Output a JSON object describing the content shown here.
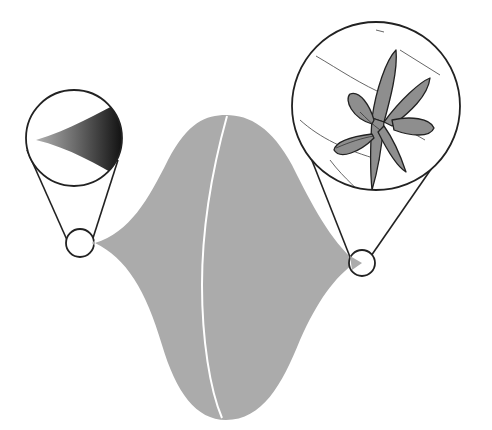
{
  "diagram": {
    "colors": {
      "background": "#ffffff",
      "body_fill": "#ababab",
      "meridian": "#ffffff",
      "outline": "#222222",
      "petal_fill": "#8e8e8e",
      "gradient_light": "#9a9a9a",
      "gradient_dark": "#111111",
      "guide_lines": "#555555"
    },
    "left_inset": {
      "label": "cusp-detail",
      "source_circle": {
        "cx": 80,
        "cy": 243,
        "r": 14
      },
      "zoom_circle": {
        "cx": 74,
        "cy": 138,
        "r": 48
      }
    },
    "right_inset": {
      "label": "flower-detail",
      "source_circle": {
        "cx": 362,
        "cy": 263,
        "r": 13
      },
      "zoom_circle": {
        "cx": 376,
        "cy": 106,
        "r": 84
      }
    }
  }
}
